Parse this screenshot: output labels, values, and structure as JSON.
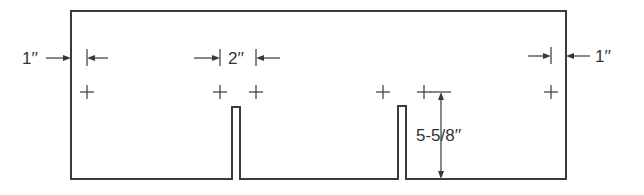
{
  "diagram": {
    "type": "panel-layout-drawing",
    "colors": {
      "line": "#3a3a3a",
      "text": "#333333",
      "background": "#ffffff"
    },
    "outline": {
      "left": 71,
      "top": 11,
      "right": 566,
      "bottom": 179,
      "slots": [
        {
          "x1": 232,
          "x2": 240,
          "top": 107
        },
        {
          "x1": 398,
          "x2": 406,
          "top": 106
        }
      ]
    },
    "marks": [
      {
        "x": 87,
        "y": 92
      },
      {
        "x": 220,
        "y": 92
      },
      {
        "x": 256,
        "y": 92
      },
      {
        "x": 383,
        "y": 92
      },
      {
        "x": 424,
        "y": 92
      },
      {
        "x": 551,
        "y": 92
      }
    ],
    "dimensions": {
      "left_margin": {
        "label": "1′′"
      },
      "spacing": {
        "label": "2′′"
      },
      "right_margin": {
        "label": "1′′"
      },
      "height": {
        "label": "5-5/8′′"
      }
    }
  }
}
